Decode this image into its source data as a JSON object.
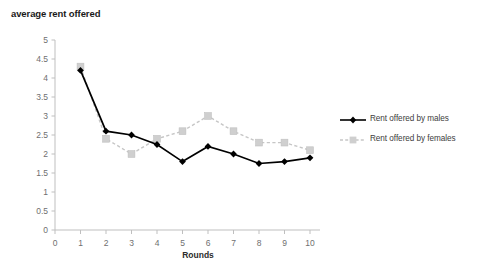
{
  "chart_data": {
    "type": "line",
    "title": "average rent offered",
    "xlabel": "Rounds",
    "ylabel": "",
    "x": [
      1,
      2,
      3,
      4,
      5,
      6,
      7,
      8,
      9,
      10
    ],
    "categories": [
      "1",
      "2",
      "3",
      "4",
      "5",
      "6",
      "7",
      "8",
      "9",
      "10"
    ],
    "series": [
      {
        "name": "Rent offered by males",
        "values": [
          4.2,
          2.6,
          2.5,
          2.25,
          1.8,
          2.2,
          2.0,
          1.75,
          1.8,
          1.9
        ],
        "color": "#000000",
        "marker": "diamond",
        "linestyle": "solid"
      },
      {
        "name": "Rent offered by females",
        "values": [
          4.3,
          2.4,
          2.0,
          2.4,
          2.6,
          3.0,
          2.6,
          2.3,
          2.3,
          2.1
        ],
        "color": "#c6c6c6",
        "marker": "square",
        "linestyle": "dashed"
      }
    ],
    "xlim": [
      0,
      10
    ],
    "ylim": [
      0,
      5
    ],
    "xticks": [
      "0",
      "1",
      "2",
      "3",
      "4",
      "5",
      "6",
      "7",
      "8",
      "9",
      "10"
    ],
    "yticks": [
      "0",
      "0.5",
      "1",
      "1.5",
      "2",
      "2.5",
      "3",
      "3.5",
      "4",
      "4.5",
      "5"
    ],
    "grid": false,
    "legend_position": "right"
  },
  "legend": {
    "entries": [
      {
        "label": "Rent offered by males"
      },
      {
        "label": "Rent offered by females"
      }
    ]
  }
}
